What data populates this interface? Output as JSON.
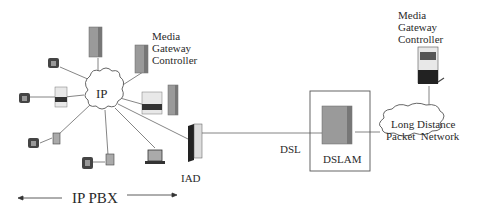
{
  "diagram": {
    "left_mgc_label": [
      "Media",
      "Gateway",
      "Controller"
    ],
    "right_mgc_label": [
      "Media",
      "Gateway",
      "Controller"
    ],
    "ip_cloud_label": "IP",
    "iad_label": "IAD",
    "dsl_label": "DSL",
    "dslam_label": "DSLAM",
    "ld_network_label": [
      "Long Distance",
      "Packet  Network"
    ],
    "ip_pbx_label": "IP PBX",
    "colors": {
      "line": "#555555",
      "server_fill": "#9a9a9a",
      "server_dark": "#5a5a5a",
      "text": "#2a2a2a",
      "background": "#ffffff"
    }
  }
}
